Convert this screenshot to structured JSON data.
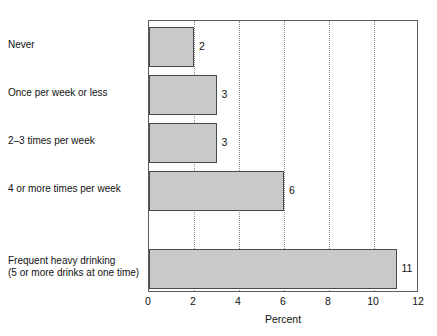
{
  "chart_data": {
    "type": "bar",
    "orientation": "horizontal",
    "title": "",
    "xlabel": "Percent",
    "ylabel": "",
    "xlim": [
      0,
      12
    ],
    "xticks": [
      0,
      2,
      4,
      6,
      8,
      10,
      12
    ],
    "xtick_labels": [
      "0",
      "2",
      "4",
      "6",
      "8",
      "10",
      "12"
    ],
    "grid": "vertical-dotted",
    "legend": "none",
    "categories": [
      "Never",
      "Once per week or less",
      "2–3 times per week",
      "4 or more times per week",
      "Frequent heavy drinking\n(5 or more drinks at one time)"
    ],
    "values": [
      2,
      3,
      3,
      6,
      11
    ],
    "value_labels": [
      "2",
      "3",
      "3",
      "6",
      "11"
    ],
    "bar_fill_color": "#c9c9c9",
    "bar_border_color": "#4a4a4a",
    "axis_color": "#5c5c5c"
  },
  "bars": [
    {
      "label_line1": "Never",
      "label_line2": "",
      "value": 2,
      "value_label": "2",
      "top": 26,
      "height": 40,
      "label_top": 39
    },
    {
      "label_line1": "Once per week or less",
      "label_line2": "",
      "value": 3,
      "value_label": "3",
      "top": 74,
      "height": 40,
      "label_top": 87
    },
    {
      "label_line1": "2–3 times per week",
      "label_line2": "",
      "value": 3,
      "value_label": "3",
      "top": 122,
      "height": 40,
      "label_top": 135
    },
    {
      "label_line1": "4 or more times per week",
      "label_line2": "",
      "value": 6,
      "value_label": "6",
      "top": 170,
      "height": 40,
      "label_top": 183
    },
    {
      "label_line1": "Frequent heavy drinking",
      "label_line2": "(5 or more drinks at one time)",
      "value": 11,
      "value_label": "11",
      "top": 248,
      "height": 40,
      "label_top": 255
    }
  ],
  "axis": {
    "title": "Percent",
    "ticks": [
      {
        "label": "0",
        "value": 0
      },
      {
        "label": "2",
        "value": 2
      },
      {
        "label": "4",
        "value": 4
      },
      {
        "label": "6",
        "value": 6
      },
      {
        "label": "8",
        "value": 8
      },
      {
        "label": "10",
        "value": 10
      },
      {
        "label": "12",
        "value": 12
      }
    ]
  }
}
